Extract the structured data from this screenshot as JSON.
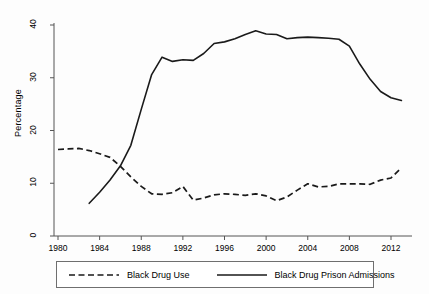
{
  "chart_data": {
    "type": "line",
    "title": "",
    "xlabel": "",
    "ylabel": "Percentage",
    "xlim": [
      1979,
      2014
    ],
    "ylim": [
      0,
      42
    ],
    "yticks": [
      0,
      10,
      20,
      30,
      40
    ],
    "xticks": [
      1980,
      1984,
      1988,
      1992,
      1996,
      2000,
      2004,
      2008,
      2012
    ],
    "grid": false,
    "legend_position": "below",
    "series": [
      {
        "name": "Black Drug Use",
        "style": "dashed",
        "color": "#1a1a1a",
        "x": [
          1980,
          1981,
          1982,
          1983,
          1984,
          1985,
          1986,
          1987,
          1988,
          1989,
          1990,
          1991,
          1992,
          1993,
          1994,
          1995,
          1996,
          1997,
          1998,
          1999,
          2000,
          2001,
          2002,
          2003,
          2004,
          2005,
          2006,
          2007,
          2008,
          2009,
          2010,
          2011,
          2012,
          2013
        ],
        "values": [
          16.4,
          16.5,
          16.6,
          16.2,
          15.6,
          14.9,
          13.2,
          11.2,
          9.4,
          8.0,
          7.9,
          8.2,
          9.4,
          6.8,
          7.2,
          7.8,
          8.0,
          7.9,
          7.7,
          8.0,
          7.6,
          6.7,
          7.4,
          8.7,
          9.9,
          9.3,
          9.4,
          9.9,
          9.9,
          9.9,
          9.8,
          10.6,
          11.0,
          12.9
        ]
      },
      {
        "name": "Black Drug Prison Admissions",
        "style": "solid",
        "color": "#1a1a1a",
        "x": [
          1983,
          1984,
          1985,
          1986,
          1987,
          1988,
          1989,
          1990,
          1991,
          1992,
          1993,
          1994,
          1995,
          1996,
          1997,
          1998,
          1999,
          2000,
          2001,
          2002,
          2003,
          2004,
          2005,
          2006,
          2007,
          2008,
          2009,
          2010,
          2011,
          2012,
          2013
        ],
        "values": [
          6.2,
          8.3,
          10.6,
          13.3,
          17.2,
          24.0,
          30.6,
          33.9,
          33.1,
          33.4,
          33.3,
          34.6,
          36.5,
          36.8,
          37.4,
          38.2,
          38.9,
          38.3,
          38.2,
          37.4,
          37.6,
          37.7,
          37.6,
          37.5,
          37.3,
          36.0,
          32.6,
          29.7,
          27.4,
          26.2,
          25.7
        ]
      }
    ]
  },
  "legend": {
    "entries": [
      {
        "label": "Black Drug Use",
        "style": "dashed"
      },
      {
        "label": "Black Drug Prison Admissions",
        "style": "solid"
      }
    ]
  },
  "axis": {
    "y_title": "Percentage",
    "y_tick_labels": [
      "0",
      "10",
      "20",
      "30",
      "40"
    ],
    "x_tick_labels": [
      "1980",
      "1984",
      "1988",
      "1992",
      "1996",
      "2000",
      "2004",
      "2008",
      "2012"
    ]
  }
}
